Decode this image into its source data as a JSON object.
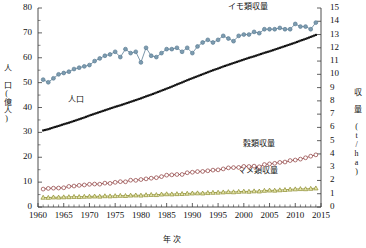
{
  "chart_data": {
    "type": "line",
    "title": "",
    "xlabel": "年 次",
    "ylabel_left": "人 口(億人)",
    "ylabel_right": "収 量 (t/ha)",
    "grid": false,
    "legend_position": "inline-annotations",
    "xlim": [
      1960,
      2015
    ],
    "xticks": [
      1960,
      1965,
      1970,
      1975,
      1980,
      1985,
      1990,
      1995,
      2000,
      2005,
      2010,
      2015
    ],
    "ylim_left": [
      0,
      80
    ],
    "yticks_left": [
      0,
      10,
      20,
      30,
      40,
      50,
      60,
      70,
      80
    ],
    "ylim_right": [
      0,
      15
    ],
    "yticks_right": [
      0,
      1,
      2,
      3,
      4,
      5,
      6,
      7,
      8,
      9,
      10,
      11,
      12,
      13,
      14,
      15
    ],
    "x": [
      1961,
      1962,
      1963,
      1964,
      1965,
      1966,
      1967,
      1968,
      1969,
      1970,
      1971,
      1972,
      1973,
      1974,
      1975,
      1976,
      1977,
      1978,
      1979,
      1980,
      1981,
      1982,
      1983,
      1984,
      1985,
      1986,
      1987,
      1988,
      1989,
      1990,
      1991,
      1992,
      1993,
      1994,
      1995,
      1996,
      1997,
      1998,
      1999,
      2000,
      2001,
      2002,
      2003,
      2004,
      2005,
      2006,
      2007,
      2008,
      2009,
      2010,
      2011,
      2012,
      2013,
      2014
    ],
    "series": [
      {
        "name": "イモ類収量",
        "axis": "right",
        "marker": "circle",
        "color": "#5b7c94",
        "fill": "#7d9cb0",
        "unit": "t/ha",
        "values": [
          9.6,
          9.4,
          9.7,
          10.0,
          10.1,
          10.2,
          10.4,
          10.5,
          10.6,
          10.7,
          11.0,
          11.2,
          11.4,
          11.5,
          11.7,
          11.3,
          11.9,
          11.6,
          11.7,
          10.9,
          12.0,
          11.4,
          11.3,
          11.6,
          11.9,
          11.9,
          12.0,
          11.7,
          12.0,
          11.6,
          12.1,
          12.4,
          12.6,
          12.4,
          12.6,
          12.9,
          12.7,
          12.5,
          12.9,
          13.0,
          13.0,
          13.2,
          13.1,
          13.4,
          13.4,
          13.4,
          13.5,
          13.4,
          13.4,
          13.8,
          13.6,
          13.6,
          13.4,
          13.9
        ]
      },
      {
        "name": "人口",
        "axis": "left",
        "marker": "dot",
        "color": "#111111",
        "unit": "億人",
        "values": [
          30.8,
          31.3,
          32.0,
          32.6,
          33.3,
          33.9,
          34.6,
          35.3,
          36.0,
          36.8,
          37.5,
          38.2,
          38.9,
          39.6,
          40.3,
          40.9,
          41.6,
          42.3,
          43.0,
          43.7,
          44.5,
          45.2,
          46.0,
          46.8,
          47.6,
          48.4,
          49.3,
          50.1,
          51.0,
          51.8,
          52.6,
          53.4,
          54.2,
          55.0,
          55.7,
          56.5,
          57.2,
          57.9,
          58.6,
          59.3,
          60.0,
          60.6,
          61.3,
          62.0,
          62.6,
          63.3,
          64.0,
          64.7,
          65.4,
          66.1,
          66.9,
          67.6,
          68.4,
          69.2
        ]
      },
      {
        "name": "穀類収量",
        "axis": "right",
        "marker": "circle",
        "color": "#8b3a3a",
        "fill": "#ffffff",
        "unit": "t/ha",
        "values": [
          1.35,
          1.4,
          1.42,
          1.43,
          1.45,
          1.55,
          1.58,
          1.63,
          1.66,
          1.71,
          1.73,
          1.72,
          1.8,
          1.78,
          1.86,
          1.91,
          1.9,
          2.02,
          2.01,
          2.07,
          2.12,
          2.17,
          2.21,
          2.29,
          2.4,
          2.42,
          2.45,
          2.45,
          2.58,
          2.62,
          2.67,
          2.68,
          2.73,
          2.78,
          2.8,
          2.87,
          2.95,
          2.97,
          2.98,
          3.06,
          3.05,
          3.08,
          3.03,
          3.2,
          3.25,
          3.29,
          3.36,
          3.39,
          3.5,
          3.54,
          3.61,
          3.71,
          3.83,
          3.93
        ]
      },
      {
        "name": "マメ類収量",
        "axis": "right",
        "marker": "triangle",
        "color": "#8a8a2a",
        "fill": "#e8e8b0",
        "unit": "t/ha",
        "values": [
          0.72,
          0.71,
          0.74,
          0.73,
          0.75,
          0.76,
          0.78,
          0.77,
          0.79,
          0.8,
          0.81,
          0.8,
          0.83,
          0.82,
          0.84,
          0.86,
          0.85,
          0.88,
          0.89,
          0.88,
          0.91,
          0.93,
          0.92,
          0.96,
          0.98,
          0.97,
          0.99,
          1.0,
          1.02,
          1.04,
          1.05,
          1.04,
          1.07,
          1.09,
          1.1,
          1.12,
          1.14,
          1.13,
          1.16,
          1.18,
          1.17,
          1.2,
          1.19,
          1.24,
          1.26,
          1.25,
          1.28,
          1.3,
          1.33,
          1.35,
          1.37,
          1.36,
          1.39,
          1.42
        ]
      }
    ],
    "annotations": [
      {
        "text": "イモ類収量",
        "x_px": 228,
        "y_px": 3
      },
      {
        "text": "人口",
        "x_px": 68,
        "y_px": 96
      },
      {
        "text": "穀類収量",
        "x_px": 243,
        "y_px": 140
      },
      {
        "text": "マメ類収量",
        "x_px": 238,
        "y_px": 167
      }
    ]
  }
}
